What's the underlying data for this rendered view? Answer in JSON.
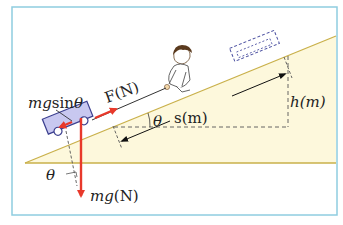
{
  "diagram": {
    "type": "inclined-plane-force-diagram",
    "labels": {
      "force_applied": "F(N)",
      "force_parallel": "mgsinθ",
      "weight": "mg(N)",
      "distance": "s(m)",
      "height": "h(m)",
      "angle_top": "θ",
      "angle_bottom": "θ"
    },
    "colors": {
      "frame": "#8fcde0",
      "slope_line": "#c9b04a",
      "slope_fill": "#fdf8dc",
      "force_arrow": "#e8392b",
      "cart_fill": "#c8c8f0",
      "cart_stroke": "#3b3f8f",
      "dashed": "#555555",
      "ghost_cart": "#4a4fa0"
    }
  }
}
